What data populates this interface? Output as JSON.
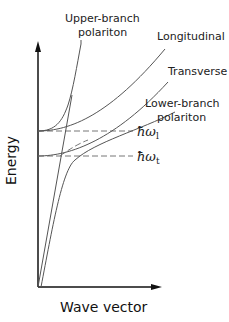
{
  "diagram": {
    "axes": {
      "y_label": "Energy",
      "x_label": "Wave vector"
    },
    "curves": {
      "upper_branch": {
        "label_line1": "Upper-branch",
        "label_line2": "polariton"
      },
      "longitudinal": {
        "label": "Longitudinal"
      },
      "transverse": {
        "label": "Transverse"
      },
      "lower_branch": {
        "label_line1": "Lower-branch",
        "label_line2": "polariton"
      }
    },
    "levels": {
      "omega_l": {
        "symbol": "ħω",
        "subscript": "l"
      },
      "omega_t": {
        "symbol": "ħω",
        "subscript": "t"
      }
    },
    "colors": {
      "curve": "#555555",
      "axis": "#111111",
      "dashed": "#777777"
    }
  }
}
